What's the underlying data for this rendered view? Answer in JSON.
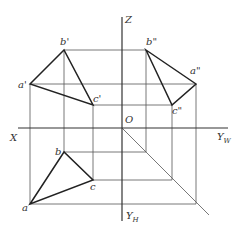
{
  "diagram": {
    "axes": {
      "Z": {
        "label": "Z",
        "x": 122,
        "y1": 17,
        "y2": 221
      },
      "X": {
        "label": "X",
        "y": 128,
        "x1": 18,
        "x2": 228
      },
      "YW": {
        "label": "Y",
        "sub": "W"
      },
      "YH": {
        "label": "Y",
        "sub": "H"
      },
      "origin": {
        "label": "O",
        "x": 122,
        "y": 128
      }
    },
    "front_view": {
      "a1": {
        "label": "a'",
        "x": 30,
        "y": 84
      },
      "b1": {
        "label": "b'",
        "x": 64,
        "y": 50
      },
      "c1": {
        "label": "c'",
        "x": 93,
        "y": 105
      }
    },
    "side_view": {
      "a2": {
        "label": "a\"",
        "x": 196,
        "y": 84
      },
      "b2": {
        "label": "b\"",
        "x": 146,
        "y": 50
      },
      "c2": {
        "label": "c\"",
        "x": 172,
        "y": 105
      }
    },
    "top_view": {
      "a": {
        "label": "a",
        "x": 30,
        "y": 204
      },
      "b": {
        "label": "b",
        "x": 64,
        "y": 152
      },
      "c": {
        "label": "c",
        "x": 93,
        "y": 180
      }
    },
    "diagonal": {
      "x1": 122,
      "y1": 128,
      "x2": 209,
      "y2": 215
    },
    "colors": {
      "line": "#222222",
      "construction": "#555555",
      "background": "#ffffff"
    }
  }
}
